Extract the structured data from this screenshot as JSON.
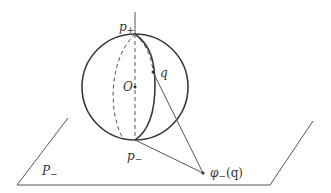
{
  "diagram": {
    "type": "stereographic-projection",
    "colors": {
      "stroke": "#3a3a3a",
      "thin": "#555555",
      "background": "#ffffff"
    },
    "labels": {
      "p_plus": "p",
      "p_plus_sub": "+",
      "p_minus": "p",
      "p_minus_sub": "−",
      "origin": "O",
      "q": "q",
      "plane": "P",
      "plane_sub": "−",
      "phi": "φ",
      "phi_sub": "−",
      "phi_arg": "(q)"
    },
    "points": {
      "p_plus": [
        135,
        34
      ],
      "p_minus": [
        135,
        140
      ],
      "origin": [
        135,
        87
      ],
      "q": [
        153,
        72
      ],
      "phi_q": [
        203,
        173
      ]
    },
    "sphere": {
      "cx": 135,
      "cy": 87,
      "r": 53
    },
    "plane": [
      [
        68,
        118
      ],
      [
        313,
        121
      ],
      [
        270,
        185
      ],
      [
        17,
        185
      ]
    ]
  }
}
